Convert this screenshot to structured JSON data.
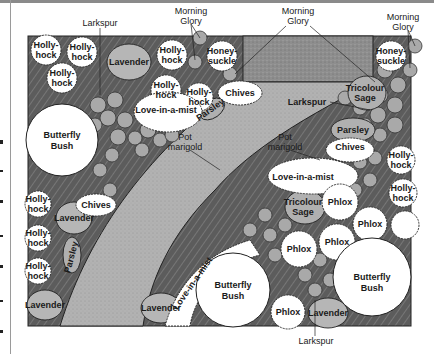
{
  "diagram": {
    "type": "garden-plan",
    "colors": {
      "bed_background": "#5a5a5a",
      "path": "#b0b0b0",
      "patio": "#8c8c8c",
      "white_plants": "#ffffff",
      "gray_plants": "#b4b4b4",
      "lavender": "#b8b8b8",
      "outline": "#222222"
    },
    "external_labels": {
      "larkspur_top": "Larkspur",
      "morning_glory_left_1": "Morning",
      "morning_glory_left_2": "Glory",
      "morning_glory_center_1": "Morning",
      "morning_glory_center_2": "Glory",
      "morning_glory_right_1": "Morning",
      "morning_glory_right_2": "Glory",
      "larkspur_bottom": "Larkspur"
    },
    "plants": {
      "hollyhock_1a": "Holly-",
      "hollyhock_1b": "hock",
      "hollyhock_2a": "Holly-",
      "hollyhock_2b": "hock",
      "hollyhock_3a": "Holly-",
      "hollyhock_3b": "hock",
      "hollyhock_4a": "Holly-",
      "hollyhock_4b": "hock",
      "hollyhock_5a": "Holly-",
      "hollyhock_5b": "hock",
      "hollyhock_6a": "Holly-",
      "hollyhock_6b": "hock",
      "hollyhock_7a": "Holly-",
      "hollyhock_7b": "hock",
      "hollyhock_8a": "Holly-",
      "hollyhock_8b": "hock",
      "hollyhock_9a": "Holly-",
      "hollyhock_9b": "hock",
      "hollyhock_10a": "Holly-",
      "hollyhock_10b": "hock",
      "hollyhock_11a": "Holly-",
      "hollyhock_11b": "hock",
      "lavender_1": "Lavender",
      "lavender_2": "Lavender",
      "lavender_3": "Lavender",
      "lavender_4": "Lavender",
      "lavender_5": "Lavender",
      "honeysuckle_1a": "Honey-",
      "honeysuckle_1b": "suckle",
      "honeysuckle_2a": "Honey-",
      "honeysuckle_2b": "suckle",
      "love_in_a_mist_1": "Love-in-a-mist",
      "love_in_a_mist_2": "Love-in-a-mist",
      "love_in_a_mist_3": "Love-in-a-mist",
      "chives_1": "Chives",
      "chives_2": "Chives",
      "chives_3": "Chives",
      "parsley_1": "Parsley",
      "parsley_2": "Parsley",
      "parsley_3": "Parsley",
      "butterfly_bush_1a": "Butterfly",
      "butterfly_bush_1b": "Bush",
      "butterfly_bush_2a": "Butterfly",
      "butterfly_bush_2b": "Bush",
      "butterfly_bush_3a": "Butterfly",
      "butterfly_bush_3b": "Bush",
      "tricolour_sage_1a": "Tricolour",
      "tricolour_sage_1b": "Sage",
      "tricolour_sage_2a": "Tricolour",
      "tricolour_sage_2b": "Sage",
      "larkspur_inner": "Larkspur",
      "pot_marigold_1a": "Pot",
      "pot_marigold_1b": "marigold",
      "pot_marigold_2a": "Pot",
      "pot_marigold_2b": "marigold",
      "phlox_1": "Phlox",
      "phlox_2": "Phlox",
      "phlox_3": "Phlox",
      "phlox_4": "Phlox",
      "phlox_5": "Phlox"
    }
  }
}
